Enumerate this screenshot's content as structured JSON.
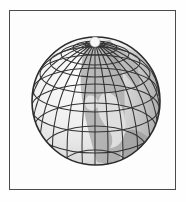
{
  "image": {
    "title": "Wireframe globe illustration",
    "subject": "earth-globe",
    "background_color": "#fefefe",
    "frame": {
      "name": "picture-frame-border",
      "color": "#4a4a4a",
      "x": 9,
      "y": 10,
      "width": 167,
      "height": 180,
      "line_width": 1,
      "fill": "#fdfdfd"
    }
  },
  "globe": {
    "label": "globe",
    "center_x": 96,
    "center_y": 101,
    "radius": 64,
    "outline_color": "#2b2b2b",
    "ocean_color": "#f2f2f2",
    "ocean_shadow_color": "#d9d9d9",
    "land_color": "#a8a8a8",
    "land_color_dark": "#8f8f8f",
    "graticule_color": "#333333",
    "graticule_line_width": 1.1,
    "pole_highlight_color": "#f7f7f7",
    "tilt_degrees": 28,
    "meridian_count": 18,
    "parallel_count": 9,
    "pole_visible": "north",
    "pole_x": 95,
    "pole_y": 42,
    "pole_radius": 6
  },
  "landmasses": [
    {
      "name": "central-vertical-band",
      "tone": "mid-gray"
    },
    {
      "name": "africa-like-shape",
      "tone": "light-gray"
    },
    {
      "name": "eastern-shaded-hemisphere",
      "tone": "mid-gray"
    },
    {
      "name": "south-eastern-patch",
      "tone": "mid-gray"
    }
  ]
}
